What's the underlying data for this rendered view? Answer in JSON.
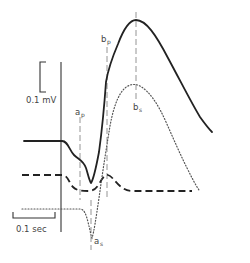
{
  "figure": {
    "type": "electrophysiology-traces-diagram",
    "ink_color": "#222222",
    "guide_color": "#888888",
    "dotted_color": "#555555",
    "scale_bars": {
      "voltage": {
        "label": "0.1 mV",
        "orientation": "vertical"
      },
      "time": {
        "label": "0.1 sec",
        "orientation": "horizontal"
      }
    },
    "markers": [
      {
        "id": "a_p",
        "base": "a",
        "subscript": "p",
        "position": "upper-left of trough"
      },
      {
        "id": "b_p",
        "base": "b",
        "subscript": "p",
        "position": "top of rising phase"
      },
      {
        "id": "b_s",
        "base": "b",
        "subscript": "s",
        "position": "below peak of solid trace"
      },
      {
        "id": "a_s",
        "base": "a",
        "subscript": "s",
        "position": "bottom of dotted trace trough"
      }
    ],
    "traces": [
      {
        "id": "solid",
        "style": "solid",
        "description": "baseline, small dip, sharp trough, large positive peak, decay"
      },
      {
        "id": "dashed",
        "style": "dashed",
        "description": "baseline, shallow negative dip, small hump, return to baseline"
      },
      {
        "id": "dotted",
        "style": "dotted",
        "description": "baseline, deep trough at a_s, positive peak, decay"
      }
    ],
    "stimulus_line": {
      "style": "solid vertical"
    }
  }
}
